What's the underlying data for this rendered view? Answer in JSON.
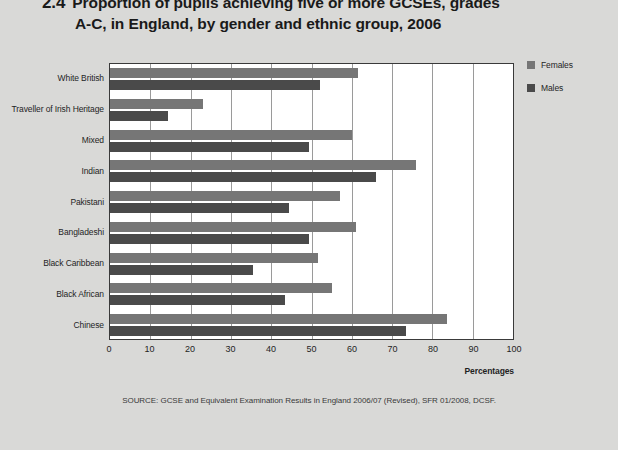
{
  "title": {
    "number": "2.4",
    "line1": "Proportion of pupils achieving five or more GCSEs, grades",
    "line2": "A-C, in England, by gender and ethnic group, 2006"
  },
  "legend": {
    "items": [
      {
        "label": "Females",
        "color": "#767676"
      },
      {
        "label": "Males",
        "color": "#4a4a4a"
      }
    ]
  },
  "source": "SOURCE: GCSE and Equivalent Examination Results in England 2006/07 (Revised), SFR 01/2008, DCSF.",
  "chart_data": {
    "type": "bar",
    "orientation": "horizontal",
    "title": "Proportion of pupils achieving five or more GCSEs, grades A-C, in England, by gender and ethnic group, 2006",
    "xlabel": "Percentages",
    "ylabel": "",
    "xlim": [
      0,
      100
    ],
    "xticks": [
      0,
      10,
      20,
      30,
      40,
      50,
      60,
      70,
      80,
      90,
      100
    ],
    "grid": true,
    "legend_position": "right",
    "categories": [
      "White British",
      "Traveller of Irish Heritage",
      "Mixed",
      "Indian",
      "Pakistani",
      "Bangladeshi",
      "Black Caribbean",
      "Black African",
      "Chinese"
    ],
    "series": [
      {
        "name": "Females",
        "color": "#767676",
        "values": [
          61.5,
          23,
          60,
          76,
          57,
          61,
          51.5,
          55,
          83.5
        ]
      },
      {
        "name": "Males",
        "color": "#4a4a4a",
        "values": [
          52,
          14.5,
          49.5,
          66,
          44.5,
          49.5,
          35.5,
          43.5,
          73.5
        ]
      }
    ]
  }
}
